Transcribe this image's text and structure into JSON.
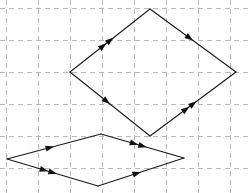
{
  "figure": {
    "background_color": "#ffffff",
    "stroke_color": "#1a1a1a",
    "grid_color": "#b9b9b9",
    "arrow_color": "#111111",
    "width": 249,
    "height": 193
  },
  "grid": {
    "type": "dashed-square-grid",
    "cell_size": 32,
    "dash_pattern": "5 4",
    "x_positions": [
      6,
      38,
      70,
      102,
      134,
      166,
      198,
      230
    ],
    "y_positions": [
      8,
      40,
      72,
      104,
      136,
      168
    ],
    "x_extent": [
      0,
      249
    ],
    "y_extent": [
      0,
      193
    ]
  },
  "shapes": [
    {
      "name": "upper-rhombus",
      "vertices": {
        "top": [
          150,
          9
        ],
        "left": [
          70,
          72
        ],
        "bottom": [
          150,
          136
        ],
        "right": [
          236,
          72
        ]
      },
      "edges": [
        {
          "name": "upper-left-edge",
          "from": "left",
          "to": "top",
          "marks": 2,
          "direction": "up-right"
        },
        {
          "name": "upper-right-edge",
          "from": "top",
          "to": "right",
          "marks": 1,
          "direction": "down-right"
        },
        {
          "name": "lower-left-edge",
          "from": "left",
          "to": "bottom",
          "marks": 1,
          "direction": "down-right"
        },
        {
          "name": "lower-right-edge",
          "from": "bottom",
          "to": "right",
          "marks": 2,
          "direction": "up-right"
        }
      ]
    },
    {
      "name": "lower-rhombus",
      "vertices": {
        "top": [
          101,
          134
        ],
        "left": [
          7,
          159
        ],
        "bottom": [
          98,
          186
        ],
        "right": [
          184,
          158
        ]
      },
      "edges": [
        {
          "name": "upper-left-edge",
          "from": "left",
          "to": "top",
          "marks": 1,
          "direction": "up-right"
        },
        {
          "name": "upper-right-edge",
          "from": "top",
          "to": "right",
          "marks": 2,
          "direction": "down-right"
        },
        {
          "name": "lower-left-edge",
          "from": "left",
          "to": "bottom",
          "marks": 2,
          "direction": "down-right"
        },
        {
          "name": "lower-right-edge",
          "from": "bottom",
          "to": "right",
          "marks": 1,
          "direction": "up-right"
        }
      ]
    }
  ]
}
